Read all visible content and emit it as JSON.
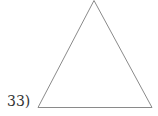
{
  "problem": {
    "number_label": "33)",
    "figure": "triangle",
    "stroke_color": "#8a8a8a"
  }
}
